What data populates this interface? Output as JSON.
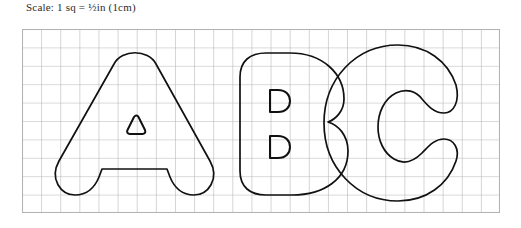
{
  "caption": {
    "prefix": "Scale: 1 sq = ",
    "fraction": "½",
    "suffix": "in (1cm)",
    "full_text": "Scale: 1 sq = ½in (1cm)",
    "text_color": "#2b2b2b"
  },
  "grid": {
    "columns": 25,
    "rows": 10,
    "cell_size_px": 19.1,
    "line_color": "#b3b3b3",
    "background": "#ffffff",
    "origin_x": 22,
    "origin_y": 29,
    "width": 478,
    "height": 184
  },
  "letters": [
    {
      "character": "A",
      "name": "letter-a",
      "style": "bubble-outline",
      "stroke_color": "#111111",
      "counter": "triangle",
      "counter_count": 1
    },
    {
      "character": "B",
      "name": "letter-b",
      "style": "bubble-outline",
      "stroke_color": "#111111",
      "counter": "d-shape",
      "counter_count": 2
    },
    {
      "character": "C",
      "name": "letter-c",
      "style": "bubble-outline",
      "stroke_color": "#111111",
      "counter": "spiral",
      "counter_count": 0
    }
  ],
  "worksheet": {
    "title_text": "ABC",
    "type": "bubble-letter-tracing-grid"
  }
}
